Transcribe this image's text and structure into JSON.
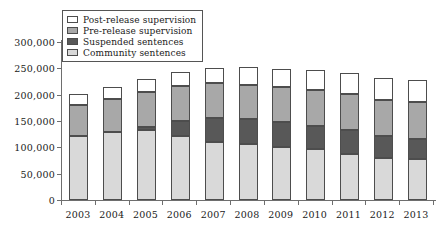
{
  "chart_data": {
    "type": "bar",
    "title": "",
    "subtitle": "",
    "xlabel": "",
    "ylabel": "",
    "stacked": true,
    "orientation": "vertical",
    "grid": false,
    "legend_position": "top-left",
    "ylim": [
      0,
      300000
    ],
    "ytick_values": [
      0,
      50000,
      100000,
      150000,
      200000,
      250000,
      300000
    ],
    "ytick_labels": [
      "0",
      "50,000",
      "100,000",
      "150,000",
      "200,000",
      "250,000",
      "300,000"
    ],
    "categories": [
      "2003",
      "2004",
      "2005",
      "2006",
      "2007",
      "2008",
      "2009",
      "2010",
      "2011",
      "2012",
      "2013"
    ],
    "series": [
      {
        "name": "Community sentences",
        "color": "#d9d9d9",
        "values": [
          121000,
          130000,
          132000,
          122000,
          111000,
          107000,
          101000,
          96000,
          88000,
          79000,
          77000
        ]
      },
      {
        "name": "Suspended sentences",
        "color": "#585858",
        "values": [
          0,
          0,
          7000,
          28000,
          45000,
          46000,
          47000,
          45000,
          44000,
          42000,
          38000
        ]
      },
      {
        "name": "Pre-release supervision",
        "color": "#a8a8a8",
        "values": [
          60000,
          61000,
          66000,
          67000,
          66000,
          65000,
          67000,
          68000,
          70000,
          68000,
          72000
        ]
      },
      {
        "name": "Post-release supervision",
        "color": "#ffffff",
        "values": [
          21000,
          23000,
          25000,
          26000,
          29000,
          34000,
          33000,
          37000,
          40000,
          43000,
          40000
        ]
      }
    ],
    "totals": [
      202000,
      214000,
      230000,
      243000,
      251000,
      252000,
      248000,
      246000,
      242000,
      232000,
      227000
    ]
  },
  "legend": {
    "entries": [
      {
        "label": "Post-release supervision",
        "swatch": "postrelease"
      },
      {
        "label": "Pre-release supervision",
        "swatch": "prerelease"
      },
      {
        "label": "Suspended sentences",
        "swatch": "suspended"
      },
      {
        "label": "Community sentences",
        "swatch": "community"
      }
    ]
  }
}
